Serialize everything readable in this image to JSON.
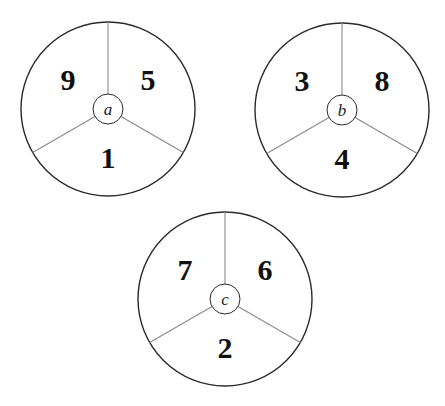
{
  "diagram": {
    "type": "spinners",
    "spinners": [
      {
        "label": "a",
        "cx": 108,
        "cy": 109,
        "r": 87,
        "inner_r": 15,
        "sections": {
          "top_left": "9",
          "top_right": "5",
          "bottom": "1"
        }
      },
      {
        "label": "b",
        "cx": 342,
        "cy": 110,
        "r": 87,
        "inner_r": 15,
        "sections": {
          "top_left": "3",
          "top_right": "8",
          "bottom": "4"
        }
      },
      {
        "label": "c",
        "cx": 225,
        "cy": 299,
        "r": 87,
        "inner_r": 15,
        "sections": {
          "top_left": "7",
          "top_right": "6",
          "bottom": "2"
        }
      }
    ],
    "colors": {
      "outline": "#2a2a2a",
      "spoke": "#8a8a8a",
      "text": "#111111",
      "background": "#ffffff"
    }
  }
}
